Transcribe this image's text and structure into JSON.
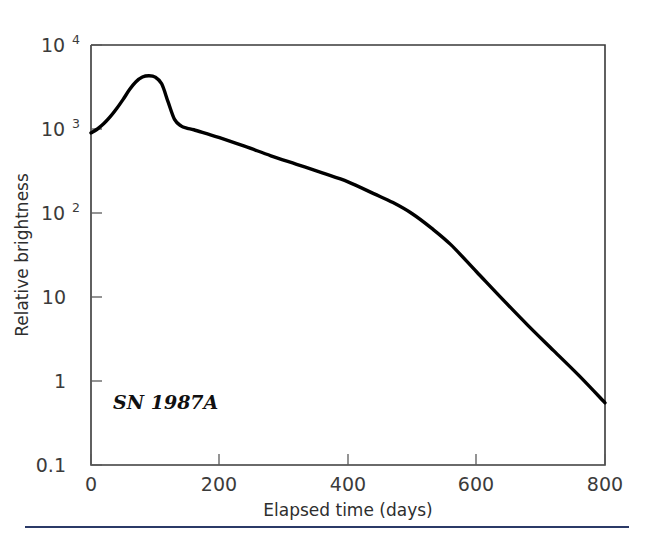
{
  "chart_data": {
    "type": "line",
    "title": "",
    "subtitle": "",
    "xlabel": "Elapsed time (days)",
    "ylabel": "Relative brightness",
    "yscale": "log",
    "xscale": "linear",
    "xlim": [
      0,
      800
    ],
    "ylim": [
      0.1,
      10000
    ],
    "grid": false,
    "legend": null,
    "annotations": [
      {
        "text": "SN 1987A",
        "x": 60,
        "y": 1.6
      }
    ],
    "xticks": [
      0,
      200,
      400,
      600,
      800
    ],
    "xtick_labels": [
      "0",
      "200",
      "400",
      "600",
      "800"
    ],
    "yticks": [
      0.1,
      1,
      10,
      100,
      1000,
      10000
    ],
    "ytick_labels": [
      "0.1",
      "1",
      "10",
      "10^2",
      "10^3",
      "10^4"
    ],
    "ytick_label_parts": [
      {
        "base": "0.1",
        "exp": ""
      },
      {
        "base": "1",
        "exp": ""
      },
      {
        "base": "10",
        "exp": ""
      },
      {
        "base": "10",
        "exp": "2"
      },
      {
        "base": "10",
        "exp": "3"
      },
      {
        "base": "10",
        "exp": "4"
      }
    ],
    "series": [
      {
        "name": "SN 1987A light curve",
        "color": "#000000",
        "x": [
          0,
          10,
          20,
          30,
          40,
          50,
          60,
          70,
          80,
          90,
          100,
          110,
          120,
          130,
          140,
          150,
          160,
          180,
          200,
          240,
          280,
          320,
          360,
          400,
          440,
          470,
          500,
          530,
          560,
          600,
          640,
          680,
          720,
          760,
          800
        ],
        "y": [
          900,
          1000,
          1160,
          1400,
          1750,
          2250,
          2950,
          3650,
          4150,
          4300,
          4150,
          3450,
          2100,
          1300,
          1090,
          1020,
          980,
          880,
          790,
          620,
          480,
          380,
          300,
          235,
          170,
          133,
          98,
          66,
          42,
          20,
          9.5,
          4.6,
          2.3,
          1.15,
          0.55
        ]
      }
    ]
  },
  "figure": {
    "background_color": "#ffffff",
    "frame_color": "#3a3a3a",
    "rule_color": "#2b3a67"
  }
}
